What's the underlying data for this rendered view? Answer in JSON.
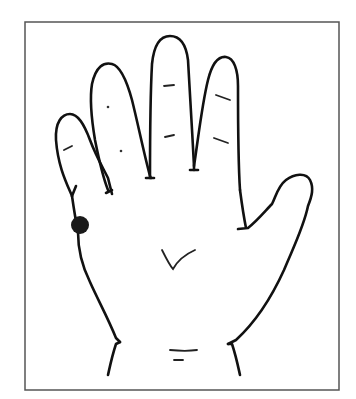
{
  "figure": {
    "view": "palm facing viewer, thumb on right",
    "border_color": "#555555",
    "line_color": "#111111",
    "background": "#ffffff",
    "marker": {
      "label": "dot marker on outer edge of hand below little finger",
      "color": "#1a1a1a",
      "cx": 80,
      "cy": 225,
      "r": 9
    }
  }
}
